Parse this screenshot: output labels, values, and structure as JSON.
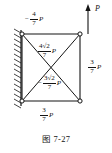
{
  "figure": {
    "caption": "图 7-27",
    "structure_type": "planar truss with cross bracing, fixed to left wall",
    "applied_load": {
      "label": "P",
      "direction": "up",
      "location": "top-right joint"
    },
    "members": [
      {
        "name": "top-chord",
        "position": "top",
        "sign": "−",
        "numerator": "4",
        "denominator": "7",
        "unit": "P",
        "full_text": "−4/7 P"
      },
      {
        "name": "right-chord",
        "position": "right",
        "sign": "",
        "numerator": "3",
        "denominator": "7",
        "unit": "P",
        "full_text": "3/7 P"
      },
      {
        "name": "bottom-chord",
        "position": "bottom",
        "sign": "",
        "numerator": "3",
        "denominator": "7",
        "unit": "P",
        "full_text": "3/7 P"
      },
      {
        "name": "diagonal-upper",
        "position": "upper diagonal",
        "sign": "",
        "numerator": "4√2",
        "numerator_coeff": "4",
        "radical": "√2",
        "denominator": "7",
        "unit": "P",
        "full_text": "4√2/7 P"
      },
      {
        "name": "diagonal-lower",
        "position": "lower diagonal",
        "sign": "−",
        "numerator": "3√2",
        "numerator_coeff": "3",
        "radical": "√2",
        "denominator": "7",
        "unit": "P",
        "full_text": "−3√2/7 P"
      }
    ],
    "joints": [
      {
        "name": "top-left",
        "support": "pinned-to-wall"
      },
      {
        "name": "top-right",
        "support": "free"
      },
      {
        "name": "bottom-left",
        "support": "pinned-to-wall"
      },
      {
        "name": "bottom-right",
        "support": "free"
      }
    ],
    "colors": {
      "line": "#141414",
      "text": "#141414",
      "background": "#ffffff",
      "joint_fill": "#ffffff"
    }
  }
}
